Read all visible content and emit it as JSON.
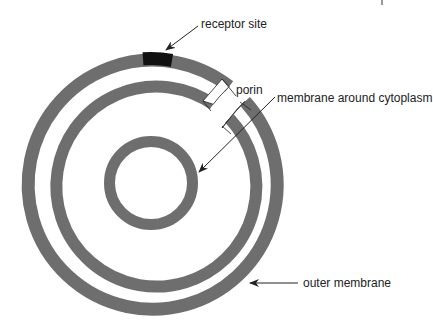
{
  "diagram": {
    "colors": {
      "membrane": "#6e6e6e",
      "receptor": "#111111",
      "porin_face": "#ffffff",
      "line": "#222222",
      "background": "#ffffff"
    },
    "labels": {
      "receptor_site": "receptor site",
      "porin": "porin",
      "membrane_around_cytoplasm": "membrane around cytoplasm",
      "outer_membrane": "outer membrane"
    },
    "rings": [
      {
        "name": "outer-membrane",
        "outer_r": 131,
        "inner_r": 118
      },
      {
        "name": "middle-membrane",
        "outer_r": 106,
        "inner_r": 94
      },
      {
        "name": "cytoplasm-membrane",
        "outer_r": 47,
        "inner_r": 36
      }
    ],
    "center": {
      "x": 151,
      "y": 183
    }
  }
}
